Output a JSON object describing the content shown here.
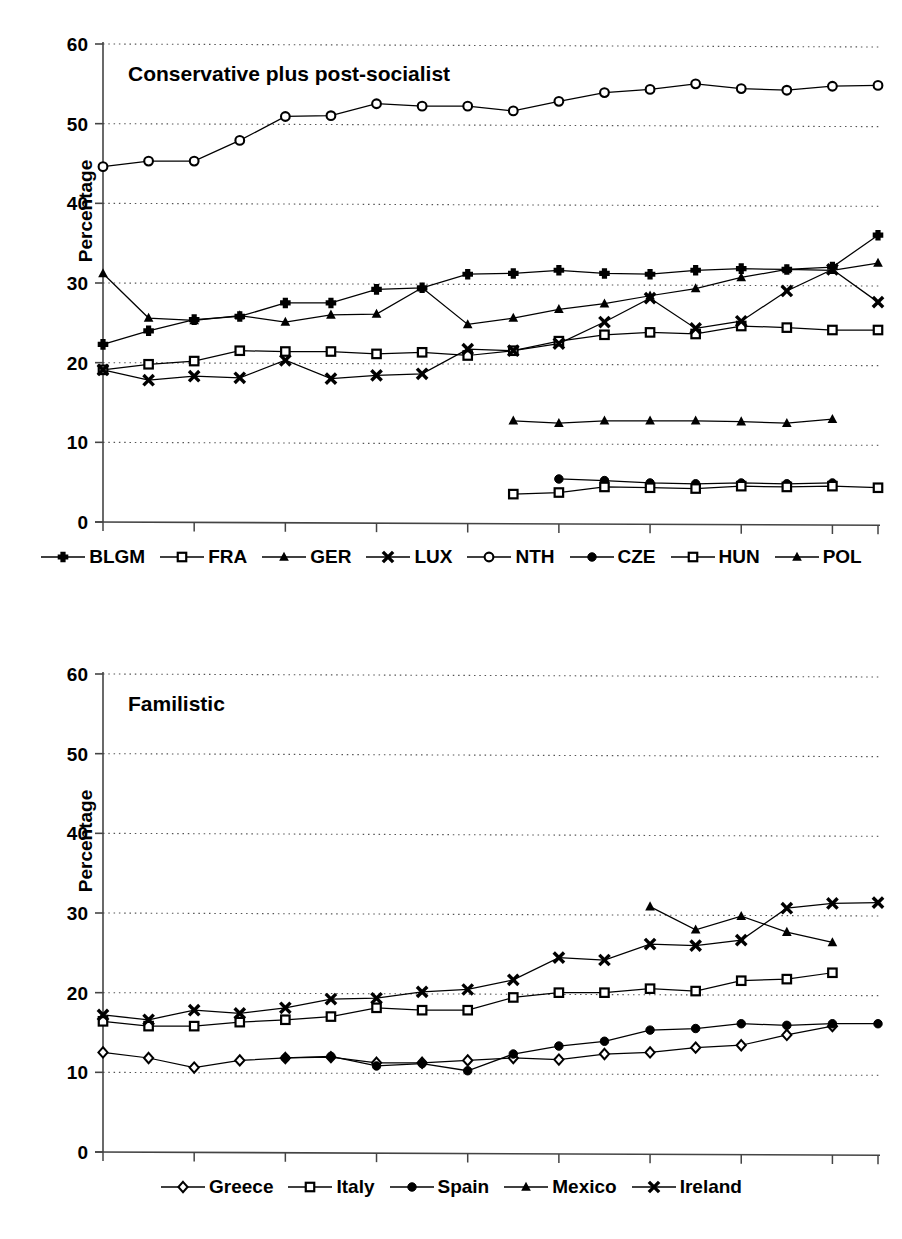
{
  "charts": [
    {
      "id": "conservative-plus-post-socialist",
      "title": "Conservative plus post-socialist",
      "ylabel": "Percentage",
      "legend": [
        {
          "name": "BLGM",
          "marker": "plus"
        },
        {
          "name": "FRA",
          "marker": "open-square"
        },
        {
          "name": "GER",
          "marker": "filled-triangle"
        },
        {
          "name": "LUX",
          "marker": "x"
        },
        {
          "name": "NTH",
          "marker": "open-circle"
        },
        {
          "name": "CZE",
          "marker": "filled-circle"
        },
        {
          "name": "HUN",
          "marker": "open-square"
        },
        {
          "name": "POL",
          "marker": "filled-triangle"
        }
      ]
    },
    {
      "id": "familistic",
      "title": "Familistic",
      "ylabel": "Percentage",
      "legend": [
        {
          "name": "Greece",
          "marker": "open-diamond"
        },
        {
          "name": "Italy",
          "marker": "open-square"
        },
        {
          "name": "Spain",
          "marker": "filled-circle"
        },
        {
          "name": "Mexico",
          "marker": "filled-triangle"
        },
        {
          "name": "Ireland",
          "marker": "x"
        }
      ]
    }
  ],
  "chart_data": [
    {
      "type": "line",
      "title": "Conservative plus post-socialist",
      "xlabel": "",
      "ylabel": "Percentage",
      "xlim": [
        1983,
        2000
      ],
      "ylim": [
        0,
        60
      ],
      "ytick_labels": [
        "0",
        "10",
        "20",
        "30",
        "40",
        "50",
        "60"
      ],
      "yticks": [
        0,
        10,
        20,
        30,
        40,
        50,
        60
      ],
      "xtick_labels": [
        "1983",
        "1985",
        "1987",
        "1989",
        "1991",
        "1993",
        "1995",
        "1997",
        "1999"
      ],
      "xticks": [
        1983,
        1985,
        1987,
        1989,
        1991,
        1993,
        1995,
        1997,
        1999
      ],
      "grid": "horizontal-dotted",
      "legend_position": "bottom",
      "x": [
        1983,
        1984,
        1985,
        1986,
        1987,
        1988,
        1989,
        1990,
        1991,
        1992,
        1993,
        1994,
        1995,
        1996,
        1997,
        1998,
        1999,
        2000
      ],
      "series": [
        {
          "name": "BLGM",
          "marker": "plus",
          "x": [
            1983,
            1984,
            1985,
            1986,
            1987,
            1988,
            1989,
            1990,
            1991,
            1992,
            1993,
            1994,
            1995,
            1996,
            1997,
            1998,
            1999,
            2000
          ],
          "values": [
            22.3,
            24.0,
            25.4,
            25.8,
            27.5,
            27.5,
            29.2,
            29.4,
            31.1,
            31.2,
            31.6,
            31.2,
            31.1,
            31.6,
            31.8,
            31.7,
            32.0,
            36.0
          ]
        },
        {
          "name": "FRA",
          "marker": "open-square",
          "x": [
            1983,
            1984,
            1985,
            1986,
            1987,
            1988,
            1989,
            1990,
            1991,
            1992,
            1993,
            1994,
            1995,
            1996,
            1997,
            1998,
            1999,
            2000
          ],
          "values": [
            19.1,
            19.8,
            20.2,
            21.5,
            21.4,
            21.4,
            21.1,
            21.3,
            20.9,
            21.5,
            22.7,
            23.5,
            23.8,
            23.6,
            24.6,
            24.4,
            24.1,
            24.1
          ]
        },
        {
          "name": "GER",
          "marker": "filled-triangle",
          "x": [
            1983,
            1984,
            1985,
            1986,
            1987,
            1988,
            1989,
            1990,
            1991,
            1992,
            1993,
            1994,
            1995,
            1996,
            1997,
            1998,
            1999,
            2000
          ],
          "values": [
            31.2,
            25.6,
            25.3,
            25.9,
            25.1,
            26.0,
            26.1,
            29.4,
            24.8,
            25.6,
            26.7,
            27.4,
            28.4,
            29.3,
            30.7,
            31.7,
            31.6,
            32.5
          ]
        },
        {
          "name": "LUX",
          "marker": "x",
          "x": [
            1983,
            1984,
            1985,
            1986,
            1987,
            1988,
            1989,
            1990,
            1991,
            1992,
            1993,
            1994,
            1995,
            1996,
            1997,
            1998,
            1999,
            2000
          ],
          "values": [
            19.1,
            17.8,
            18.3,
            18.1,
            20.3,
            18.0,
            18.4,
            18.6,
            21.7,
            21.5,
            22.4,
            25.1,
            28.1,
            24.3,
            25.2,
            29.0,
            31.7,
            27.6
          ]
        },
        {
          "name": "NTH",
          "marker": "open-circle",
          "x": [
            1983,
            1984,
            1985,
            1986,
            1987,
            1988,
            1989,
            1990,
            1991,
            1992,
            1993,
            1994,
            1995,
            1996,
            1997,
            1998,
            1999,
            2000
          ],
          "values": [
            44.6,
            45.3,
            45.3,
            47.9,
            50.9,
            51.0,
            52.5,
            52.2,
            52.2,
            51.6,
            52.8,
            53.9,
            54.3,
            55.0,
            54.4,
            54.2,
            54.7,
            54.8
          ]
        },
        {
          "name": "CZE",
          "marker": "filled-circle",
          "x": [
            1993,
            1994,
            1995,
            1996,
            1997,
            1998,
            1999
          ],
          "values": [
            5.4,
            5.2,
            4.9,
            4.8,
            4.9,
            4.8,
            4.9
          ]
        },
        {
          "name": "HUN",
          "marker": "open-square",
          "x": [
            1992,
            1993,
            1994,
            1995,
            1996,
            1997,
            1998,
            1999,
            2000
          ],
          "values": [
            3.5,
            3.7,
            4.4,
            4.3,
            4.2,
            4.5,
            4.4,
            4.5,
            4.3
          ]
        },
        {
          "name": "POL",
          "marker": "filled-triangle",
          "x": [
            1992,
            1993,
            1994,
            1995,
            1996,
            1997,
            1998,
            1999
          ],
          "values": [
            12.7,
            12.4,
            12.7,
            12.7,
            12.7,
            12.6,
            12.4,
            12.9
          ]
        }
      ]
    },
    {
      "type": "line",
      "title": "Familistic",
      "xlabel": "",
      "ylabel": "Percentage",
      "xlim": [
        1983,
        2000
      ],
      "ylim": [
        0,
        60
      ],
      "ytick_labels": [
        "0",
        "10",
        "20",
        "30",
        "40",
        "50",
        "60"
      ],
      "yticks": [
        0,
        10,
        20,
        30,
        40,
        50,
        60
      ],
      "xtick_labels": [
        "1983",
        "1985",
        "1987",
        "1989",
        "1991",
        "1993",
        "1995",
        "1997",
        "1999"
      ],
      "xticks": [
        1983,
        1985,
        1987,
        1989,
        1991,
        1993,
        1995,
        1997,
        1999
      ],
      "grid": "horizontal-dotted",
      "legend_position": "bottom",
      "x": [
        1983,
        1984,
        1985,
        1986,
        1987,
        1988,
        1989,
        1990,
        1991,
        1992,
        1993,
        1994,
        1995,
        1996,
        1997,
        1998,
        1999,
        2000
      ],
      "series": [
        {
          "name": "Greece",
          "marker": "open-diamond",
          "x": [
            1983,
            1984,
            1985,
            1986,
            1987,
            1988,
            1989,
            1990,
            1991,
            1992,
            1993,
            1994,
            1995,
            1996,
            1997,
            1998,
            1999
          ],
          "values": [
            12.5,
            11.8,
            10.6,
            11.5,
            11.8,
            11.9,
            11.2,
            11.2,
            11.5,
            11.8,
            11.6,
            12.3,
            12.5,
            13.1,
            13.4,
            14.7,
            15.8
          ]
        },
        {
          "name": "Italy",
          "marker": "open-square",
          "x": [
            1983,
            1984,
            1985,
            1986,
            1987,
            1988,
            1989,
            1990,
            1991,
            1992,
            1993,
            1994,
            1995,
            1996,
            1997,
            1998,
            1999
          ],
          "values": [
            16.4,
            15.8,
            15.8,
            16.3,
            16.6,
            17.0,
            18.1,
            17.8,
            17.8,
            19.4,
            20.0,
            20.0,
            20.5,
            20.2,
            21.5,
            21.7,
            22.5
          ]
        },
        {
          "name": "Spain",
          "marker": "filled-circle",
          "x": [
            1987,
            1988,
            1989,
            1990,
            1991,
            1992,
            1993,
            1994,
            1995,
            1996,
            1997,
            1998,
            1999,
            2000
          ],
          "values": [
            11.8,
            12.0,
            10.8,
            11.1,
            10.2,
            12.3,
            13.3,
            13.9,
            15.3,
            15.5,
            16.1,
            15.9,
            16.1,
            16.1
          ]
        },
        {
          "name": "Mexico",
          "marker": "filled-triangle",
          "x": [
            1995,
            1996,
            1997,
            1998,
            1999
          ],
          "values": [
            30.8,
            27.9,
            29.6,
            27.6,
            26.3
          ]
        },
        {
          "name": "Ireland",
          "marker": "x",
          "x": [
            1983,
            1984,
            1985,
            1986,
            1987,
            1988,
            1989,
            1990,
            1991,
            1992,
            1993,
            1994,
            1995,
            1996,
            1997,
            1998,
            1999,
            2000
          ],
          "values": [
            17.2,
            16.6,
            17.8,
            17.4,
            18.1,
            19.2,
            19.3,
            20.1,
            20.4,
            21.6,
            24.4,
            24.1,
            26.1,
            25.9,
            26.6,
            30.6,
            31.2,
            31.3
          ]
        }
      ]
    }
  ]
}
